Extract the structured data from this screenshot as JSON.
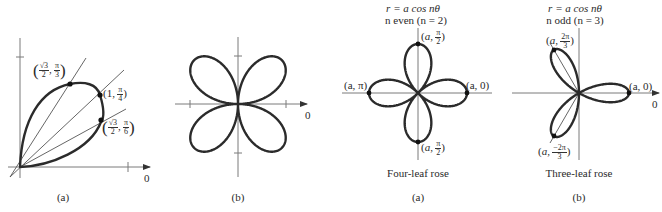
{
  "figures": [
    {
      "id": "left-a",
      "caption": "(a)",
      "zero_label": "0",
      "description": "Single petal (one leaf of r = sin 2θ) in the first quadrant with rays at π/6, π/4, π/3",
      "points": [
        {
          "r_num": "√3",
          "r_den": "2",
          "theta_num": "π",
          "theta_den": "3"
        },
        {
          "r": "1",
          "theta_num": "π",
          "theta_den": "4"
        },
        {
          "r_num": "√3",
          "r_den": "2",
          "theta_num": "π",
          "theta_den": "6"
        }
      ]
    },
    {
      "id": "left-b",
      "caption": "(b)",
      "zero_label": "0",
      "description": "Four-leaf rose with petals in each quadrant"
    },
    {
      "id": "right-a",
      "equation": "r = a cos nθ",
      "condition": "n even (n = 2)",
      "title": "Four-leaf rose",
      "caption": "(a)",
      "points": {
        "top": {
          "r": "a",
          "theta_num": "π",
          "theta_den": "2"
        },
        "left": {
          "text": "(a, π)"
        },
        "right": {
          "text": "(a, 0)"
        },
        "bottom": {
          "r": "a",
          "theta_num": "π",
          "theta_den": "2"
        }
      }
    },
    {
      "id": "right-b",
      "equation": "r = a cos nθ",
      "condition": "n odd (n = 3)",
      "title": "Three-leaf rose",
      "caption": "(b)",
      "zero_label": "0",
      "points": {
        "upper": {
          "r": "a",
          "theta_num": "2π",
          "theta_den": "3"
        },
        "right": {
          "text": "(a, 0)"
        },
        "lower": {
          "r": "a",
          "theta_num": "−2π",
          "theta_den": "3"
        }
      }
    }
  ],
  "style": {
    "curve_color": "#2b2b2b",
    "axis_color": "#7a7a7a",
    "background": "#ffffff"
  }
}
